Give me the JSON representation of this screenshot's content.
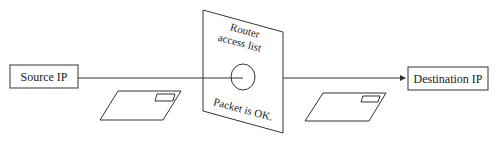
{
  "diagram": {
    "source_node": {
      "label": "Source IP"
    },
    "destination_node": {
      "label": "Destination IP"
    },
    "router_panel": {
      "title_line1": "Router",
      "title_line2": "access list",
      "status": "Packet is OK."
    },
    "colors": {
      "stroke": "#333333",
      "background": "#ffffff",
      "text": "#222222"
    }
  }
}
